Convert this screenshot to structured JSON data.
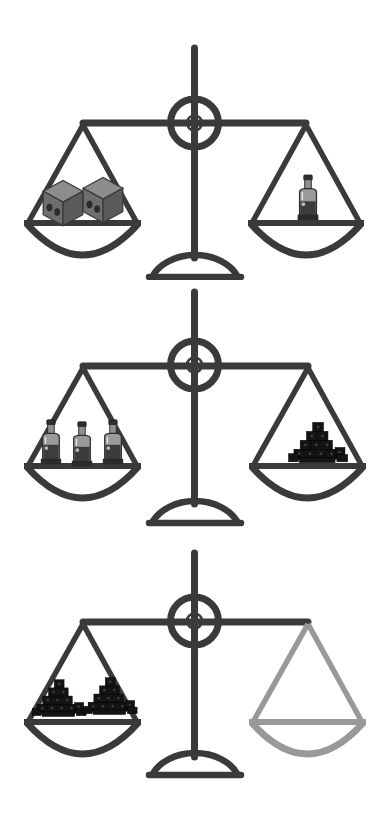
{
  "image": {
    "type": "balance-scale-puzzle",
    "title": "Balance scale weight comparison puzzle",
    "background_color": "#ffffff",
    "width": 389,
    "height": 820
  },
  "colors": {
    "frame_dark": "#3a3a3a",
    "frame_unknown_gray": "#999999",
    "cube_gray_front": "#6e6e6e",
    "cube_gray_top": "#8d8d8d",
    "cube_gray_side": "#5a5a5a",
    "cube_dot": "#2b2b2b",
    "bottle_body": "#3c3c3c",
    "bottle_glass": "#9a9a9a",
    "bottle_highlight": "#d8d8d8",
    "coal_dark": "#121212",
    "coal_face": "#1d1d1d",
    "coal_speck": "#4a4a4a"
  },
  "scales": [
    {
      "id": "scale-1",
      "name": "first-balance-scale",
      "state": "balanced",
      "left_pan": {
        "name": "left-pan",
        "item_type": "gray-cube",
        "item_label": "cube",
        "count": 2
      },
      "right_pan": {
        "name": "right-pan",
        "item_type": "bottle",
        "item_label": "bottle",
        "count": 1
      }
    },
    {
      "id": "scale-2",
      "name": "second-balance-scale",
      "state": "balanced",
      "left_pan": {
        "name": "left-pan",
        "item_type": "bottle",
        "item_label": "bottle",
        "count": 3
      },
      "right_pan": {
        "name": "right-pan",
        "item_type": "coal-pile",
        "item_label": "coal pile",
        "count": 1
      }
    },
    {
      "id": "scale-3",
      "name": "third-balance-scale",
      "state": "balanced",
      "left_pan": {
        "name": "left-pan",
        "item_type": "coal-pile",
        "item_label": "coal pile",
        "count": 2
      },
      "right_pan": {
        "name": "right-pan-unknown",
        "item_type": "empty",
        "item_label": "unknown",
        "count": 0,
        "highlight": "gray-outline"
      }
    }
  ]
}
